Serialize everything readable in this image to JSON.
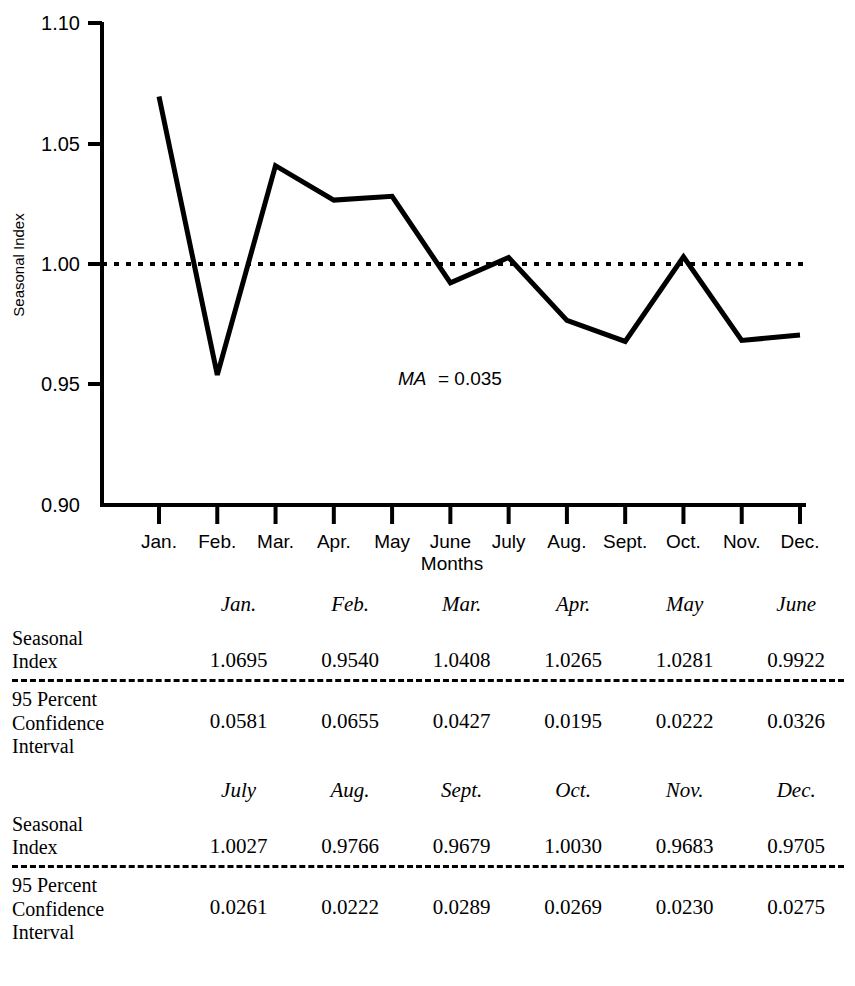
{
  "chart_data": {
    "type": "line",
    "title": "",
    "xlabel": "Months",
    "ylabel": "Seasonal Index",
    "ylim": [
      0.9,
      1.1
    ],
    "yticks": [
      "0.90",
      "0.95",
      "1.00",
      "1.05",
      "1.10"
    ],
    "ytick_values": [
      0.9,
      0.95,
      1.0,
      1.05,
      1.1
    ],
    "categories": [
      "Jan.",
      "Feb.",
      "Mar.",
      "Apr.",
      "May",
      "June",
      "July",
      "Aug.",
      "Sept.",
      "Oct.",
      "Nov.",
      "Dec."
    ],
    "values": [
      1.0695,
      0.954,
      1.0408,
      1.0265,
      1.0281,
      0.9922,
      1.0027,
      0.9766,
      0.9679,
      1.003,
      0.9683,
      0.9705
    ],
    "reference_line": {
      "y": 1.0,
      "style": "dotted"
    },
    "grid": false,
    "legend": "none",
    "annotations": [
      {
        "italic_text": "MA",
        "plain_text": " = 0.035",
        "x": 0.42,
        "y": 0.952
      }
    ]
  },
  "annotation": {
    "ma_symbol": "MA",
    "ma_value": "= 0.035"
  },
  "axis": {
    "y_title": "Seasonal Index",
    "x_title": "Months"
  },
  "tables": [
    {
      "headers": [
        "Jan.",
        "Feb.",
        "Mar.",
        "Apr.",
        "May",
        "June"
      ],
      "rows": [
        {
          "label": "Seasonal\nIndex",
          "values": [
            "1.0695",
            "0.9540",
            "1.0408",
            "1.0265",
            "1.0281",
            "0.9922"
          ]
        },
        {
          "label": "95 Percent\nConfidence\nInterval",
          "values": [
            "0.0581",
            "0.0655",
            "0.0427",
            "0.0195",
            "0.0222",
            "0.0326"
          ]
        }
      ]
    },
    {
      "headers": [
        "July",
        "Aug.",
        "Sept.",
        "Oct.",
        "Nov.",
        "Dec."
      ],
      "rows": [
        {
          "label": "Seasonal\nIndex",
          "values": [
            "1.0027",
            "0.9766",
            "0.9679",
            "1.0030",
            "0.9683",
            "0.9705"
          ]
        },
        {
          "label": "95 Percent\nConfidence\nInterval",
          "values": [
            "0.0261",
            "0.0222",
            "0.0289",
            "0.0269",
            "0.0230",
            "0.0275"
          ]
        }
      ]
    }
  ],
  "colors": {
    "ink": "#000000",
    "background": "#ffffff"
  }
}
